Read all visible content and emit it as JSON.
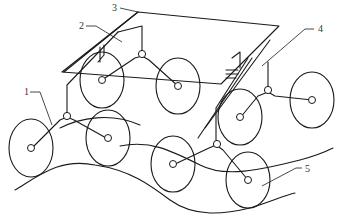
{
  "figure": {
    "type": "patent-style line drawing",
    "stroke_color": "#1a1a1a",
    "background": "#ffffff"
  },
  "labels": [
    {
      "id": "1",
      "text": "1",
      "x": 24,
      "y": 95,
      "target": "front-left rocker arm"
    },
    {
      "id": "2",
      "text": "2",
      "x": 79,
      "y": 29,
      "target": "rear-left rocker arm"
    },
    {
      "id": "3",
      "text": "3",
      "x": 112,
      "y": 11,
      "target": "vehicle body platform"
    },
    {
      "id": "4",
      "text": "4",
      "x": 318,
      "y": 32,
      "target": "rear-right rocker arm"
    },
    {
      "id": "5",
      "text": "5",
      "x": 305,
      "y": 172,
      "target": "wheel"
    }
  ],
  "components": {
    "platform": "3",
    "rockers": [
      "1",
      "2",
      "4"
    ],
    "wheel": "5",
    "wheel_count": 8
  }
}
